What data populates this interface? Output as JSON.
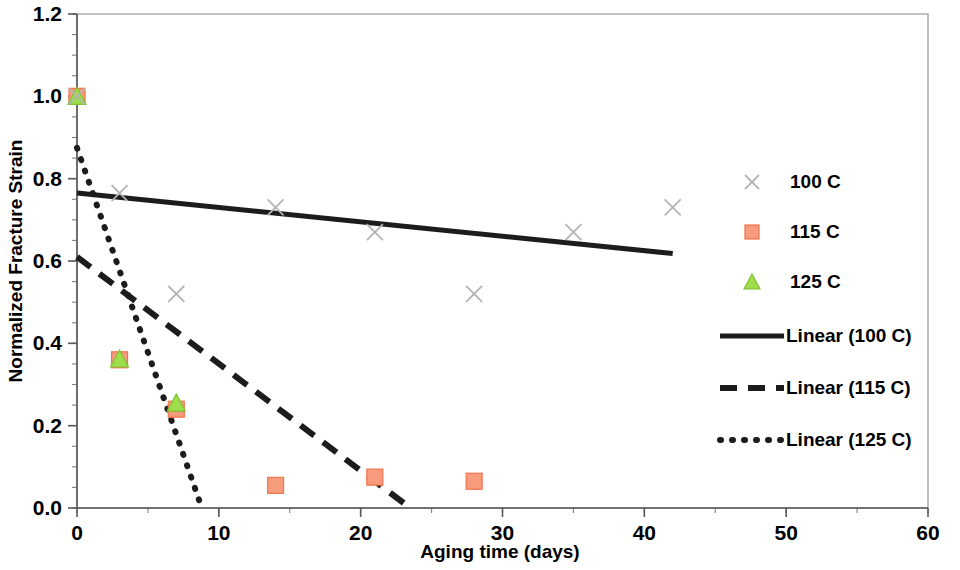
{
  "chart_data": {
    "type": "scatter",
    "title": "",
    "xlabel": "Aging time (days)",
    "ylabel": "Normalized Fracture Strain",
    "xlim": [
      0,
      60
    ],
    "ylim": [
      0.0,
      1.2
    ],
    "x_ticks": [
      0,
      10,
      20,
      30,
      40,
      50,
      60
    ],
    "x_tick_labels": [
      "0",
      "10",
      "20",
      "30",
      "40",
      "50",
      "60"
    ],
    "x_minor_step": 5,
    "y_ticks": [
      0.0,
      0.2,
      0.4,
      0.6,
      0.8,
      1.0,
      1.2
    ],
    "y_tick_labels": [
      "0.0",
      "0.2",
      "0.4",
      "0.6",
      "0.8",
      "1.0",
      "1.2"
    ],
    "y_minor_step": 0.05,
    "grid": false,
    "legend_position": "right",
    "series": [
      {
        "name": "100 C",
        "marker": "x",
        "color": "#b3b3b3",
        "x": [
          0,
          3,
          7,
          14,
          21,
          28,
          35,
          42
        ],
        "y": [
          1.0,
          0.765,
          0.52,
          0.73,
          0.67,
          0.52,
          0.67,
          0.73
        ]
      },
      {
        "name": "115 C",
        "marker": "square",
        "color": "#f79b7d",
        "x": [
          0,
          3,
          7,
          14,
          21,
          28
        ],
        "y": [
          1.0,
          0.36,
          0.24,
          0.055,
          0.075,
          0.065
        ]
      },
      {
        "name": "125 C",
        "marker": "triangle",
        "color": "#9ede4b",
        "x": [
          0,
          3,
          7
        ],
        "y": [
          1.0,
          0.362,
          0.255
        ]
      }
    ],
    "trendlines": [
      {
        "name": "Linear (100 C)",
        "style": "solid",
        "color": "#1c1c1c",
        "x0": 0,
        "y0": 0.765,
        "x1": 42,
        "y1": 0.618
      },
      {
        "name": "Linear (115 C)",
        "style": "dashed",
        "color": "#1c1c1c",
        "x0": 0,
        "y0": 0.61,
        "x1": 23.5,
        "y1": 0.0
      },
      {
        "name": "Linear (125 C)",
        "style": "dotted",
        "color": "#1c1c1c",
        "x0": 0,
        "y0": 0.875,
        "x1": 8.8,
        "y1": 0.0
      }
    ],
    "legend": [
      {
        "label": "100 C",
        "kind": "marker",
        "marker": "x",
        "color": "#b3b3b3"
      },
      {
        "label": "115 C",
        "kind": "marker",
        "marker": "square",
        "color": "#f79b7d"
      },
      {
        "label": "125 C",
        "kind": "marker",
        "marker": "triangle",
        "color": "#9ede4b"
      },
      {
        "label": "Linear (100 C)",
        "kind": "line",
        "style": "solid",
        "color": "#1c1c1c"
      },
      {
        "label": "Linear (115 C)",
        "kind": "line",
        "style": "dashed",
        "color": "#1c1c1c"
      },
      {
        "label": "Linear (125 C)",
        "kind": "line",
        "style": "dotted",
        "color": "#1c1c1c"
      }
    ]
  }
}
